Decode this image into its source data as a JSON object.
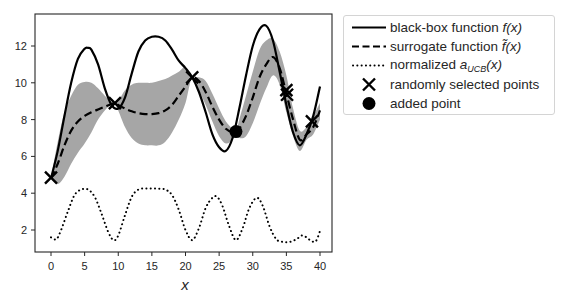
{
  "chart_data": {
    "type": "line",
    "title": "",
    "xlabel": "x",
    "ylabel": "",
    "xlim": [
      -2,
      41
    ],
    "ylim": [
      0.8,
      13.74
    ],
    "grid": false,
    "legend_position": "outside upper right",
    "xticks": [
      0,
      5,
      10,
      15,
      20,
      25,
      30,
      35,
      40
    ],
    "yticks": [
      2,
      4,
      6,
      8,
      10,
      12
    ],
    "series": [
      {
        "name": "black-box function f(x)",
        "style": "solid",
        "x": [
          0,
          1,
          2,
          3,
          4,
          5,
          5.5,
          6,
          7,
          8,
          9,
          10,
          11,
          12,
          13,
          14,
          15,
          16,
          17,
          18,
          19,
          20,
          21,
          22,
          23,
          24,
          25,
          26,
          27,
          28,
          29,
          30,
          31,
          32,
          33,
          34,
          35,
          36,
          37,
          38,
          39,
          40
        ],
        "y": [
          4.8,
          6.3,
          8.2,
          10.0,
          11.3,
          11.85,
          11.9,
          11.8,
          11.0,
          9.7,
          8.8,
          8.6,
          9.2,
          10.5,
          11.7,
          12.3,
          12.5,
          12.5,
          12.3,
          11.8,
          11.2,
          10.8,
          10.3,
          9.5,
          8.4,
          7.2,
          6.5,
          6.3,
          7.0,
          8.6,
          10.4,
          12.0,
          12.9,
          13.1,
          12.3,
          10.6,
          8.8,
          7.3,
          6.6,
          7.2,
          8.2,
          9.8
        ]
      },
      {
        "name": "surrogate function f~(x)",
        "style": "dashed",
        "x": [
          0,
          1,
          2,
          3,
          4,
          5,
          6,
          7,
          8,
          9,
          9.5,
          10,
          11,
          12,
          13,
          14,
          15,
          16,
          17,
          18,
          19,
          20,
          21,
          22,
          23,
          24,
          25,
          26,
          27,
          27.5,
          28,
          29,
          30,
          31,
          32,
          33,
          34,
          35,
          36,
          37,
          38,
          39,
          40
        ],
        "y": [
          4.8,
          5.6,
          6.6,
          7.4,
          7.9,
          8.2,
          8.4,
          8.55,
          8.7,
          8.85,
          8.9,
          8.8,
          8.6,
          8.45,
          8.35,
          8.3,
          8.3,
          8.35,
          8.5,
          8.8,
          9.3,
          9.8,
          10.3,
          10.1,
          9.5,
          8.7,
          8.0,
          7.5,
          7.3,
          7.3,
          7.5,
          8.2,
          9.2,
          10.3,
          11.0,
          11.4,
          10.8,
          9.4,
          8.0,
          6.9,
          7.2,
          7.6,
          8.5
        ]
      },
      {
        "name": "confidence band (surrogate ± σ)",
        "style": "fill",
        "color": "#a6a6a6",
        "x": [
          0,
          1,
          2,
          3,
          4,
          5,
          6,
          7,
          8,
          9,
          9.5,
          10,
          11,
          12,
          13,
          14,
          15,
          16,
          17,
          18,
          19,
          20,
          21,
          22,
          23,
          24,
          25,
          26,
          27,
          27.5,
          28,
          29,
          30,
          31,
          32,
          33,
          34,
          35,
          36,
          37,
          38,
          39,
          40
        ],
        "upper": [
          4.8,
          6.8,
          8.4,
          9.3,
          9.9,
          10.05,
          10.0,
          9.7,
          9.3,
          8.95,
          8.9,
          9.0,
          9.6,
          9.9,
          10.0,
          10.0,
          10.0,
          10.1,
          10.2,
          10.4,
          10.6,
          10.85,
          10.3,
          10.3,
          10.1,
          9.4,
          8.6,
          7.9,
          7.5,
          7.3,
          8.0,
          9.3,
          10.6,
          11.8,
          12.3,
          12.4,
          11.7,
          10.4,
          8.6,
          7.4,
          7.6,
          8.2,
          8.9
        ],
        "lower": [
          4.8,
          4.5,
          4.9,
          5.6,
          6.2,
          6.7,
          7.3,
          8.0,
          8.5,
          8.85,
          8.9,
          8.5,
          7.6,
          7.0,
          6.7,
          6.6,
          6.6,
          6.6,
          6.8,
          7.3,
          8.0,
          8.9,
          10.3,
          9.6,
          8.8,
          7.9,
          7.1,
          6.7,
          6.9,
          7.3,
          7.0,
          7.1,
          7.8,
          8.8,
          9.7,
          10.4,
          9.9,
          8.4,
          7.1,
          6.3,
          6.9,
          7.2,
          8.0
        ]
      },
      {
        "name": "normalized a_UCB(x)",
        "style": "dotted",
        "x": [
          0,
          0.8,
          1.5,
          2.5,
          3.5,
          4.5,
          5.5,
          6.5,
          7.5,
          8.5,
          9.3,
          10,
          11,
          12,
          13,
          14,
          15,
          16,
          17,
          18,
          19,
          20,
          21,
          22,
          23,
          24,
          24.7,
          25.5,
          26.5,
          27.5,
          28.5,
          29.5,
          30.6,
          31.5,
          32.5,
          33.5,
          34.5,
          35.5,
          36.5,
          37.3,
          38,
          38.7,
          39.4,
          40
        ],
        "y": [
          1.6,
          1.5,
          2.0,
          3.0,
          3.9,
          4.2,
          4.2,
          3.8,
          2.9,
          1.9,
          1.45,
          1.7,
          2.8,
          3.8,
          4.2,
          4.25,
          4.25,
          4.25,
          4.2,
          3.9,
          3.1,
          2.0,
          1.45,
          2.1,
          3.2,
          3.75,
          3.8,
          3.3,
          2.2,
          1.45,
          2.1,
          3.2,
          3.75,
          3.3,
          2.2,
          1.5,
          1.35,
          1.35,
          1.5,
          1.7,
          1.6,
          1.4,
          1.4,
          1.95
        ]
      }
    ],
    "markers": {
      "randomly_selected_points": {
        "symbol": "x",
        "points": [
          [
            0,
            4.85
          ],
          [
            9.5,
            8.9
          ],
          [
            21,
            10.3
          ],
          [
            35,
            9.6
          ],
          [
            35.1,
            9.35
          ],
          [
            38.8,
            7.9
          ]
        ]
      },
      "added_point": {
        "symbol": "circle",
        "points": [
          [
            27.5,
            7.35
          ]
        ]
      }
    },
    "legend": [
      "black-box function f(x)",
      "surrogate function f~(x)",
      "normalized a_UCB(x)",
      "randomly selected points",
      "added point"
    ]
  },
  "axes": {
    "x_label": "x",
    "x_ticks": [
      "0",
      "5",
      "10",
      "15",
      "20",
      "25",
      "30",
      "35",
      "40"
    ],
    "y_ticks": [
      "2",
      "4",
      "6",
      "8",
      "10",
      "12"
    ]
  },
  "legend": {
    "items": [
      {
        "prefix": "black-box function ",
        "math": "f",
        "suffix": "(x)"
      },
      {
        "prefix": "surrogate function ",
        "math": "f̃",
        "suffix": "(x)"
      },
      {
        "prefix": "normalized ",
        "math": "a",
        "sub": "UCB",
        "suffix": "(x)"
      },
      {
        "prefix": "randomly selected points",
        "math": "",
        "suffix": ""
      },
      {
        "prefix": "added point",
        "math": "",
        "suffix": ""
      }
    ]
  }
}
